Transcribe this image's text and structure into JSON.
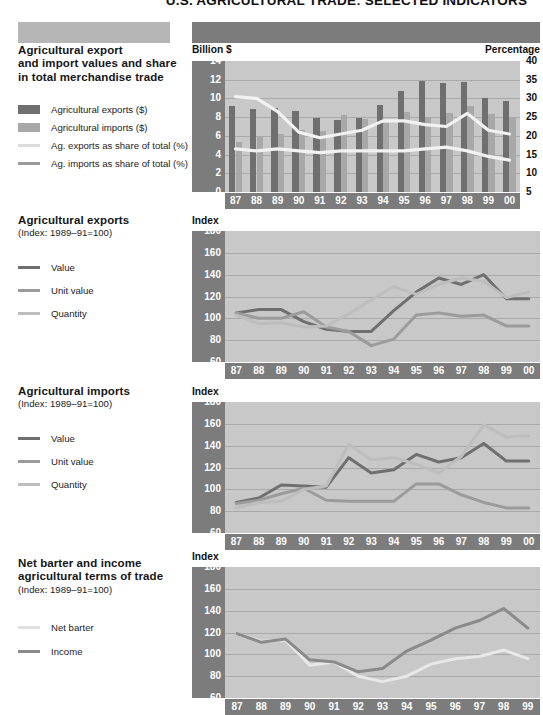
{
  "document": {
    "title": "U.S. AGRICULTURAL TRADE: SELECTED INDICATORS"
  },
  "colors": {
    "export_bar": "#6f6f6f",
    "import_bar": "#a8a8a8",
    "plot_bg": "#c8c8c8",
    "band": "#7c7c7c",
    "header_left": "#b6b6b6",
    "header_right": "#7c7c7c",
    "line_light": "#f2f2f2",
    "line_mid": "#9b9b9b",
    "line_dark": "#6f6f6f",
    "gridline": "#a9a9a9"
  },
  "sections": [
    {
      "title_line1": "Agricultural export",
      "title_line2": "and import values and share",
      "title_line3": "in total merchandise trade",
      "subtitle": "",
      "legend": [
        {
          "label": "Agricultural exports ($)",
          "swatch": "block",
          "color": "#6f6f6f"
        },
        {
          "label": "Agricultural imports ($)",
          "swatch": "block",
          "color": "#a8a8a8"
        },
        {
          "label": "Ag. exports as share of total (%)",
          "swatch": "line",
          "color": "#f2f2f2"
        },
        {
          "label": "Ag. imports as share of total (%)",
          "swatch": "line",
          "color": "#9b9b9b"
        }
      ]
    },
    {
      "title_line1": "Agricultural exports",
      "title_line2": "",
      "title_line3": "",
      "subtitle": "(Index: 1989–91=100)",
      "legend": [
        {
          "label": "Value",
          "swatch": "line",
          "color": "#6f6f6f"
        },
        {
          "label": "Unit value",
          "swatch": "line",
          "color": "#9b9b9b"
        },
        {
          "label": "Quantity",
          "swatch": "line",
          "color": "#bdbdbd"
        }
      ]
    },
    {
      "title_line1": "Agricultural imports",
      "title_line2": "",
      "title_line3": "",
      "subtitle": "(Index: 1989–91=100)",
      "legend": [
        {
          "label": "Value",
          "swatch": "line",
          "color": "#6f6f6f"
        },
        {
          "label": "Unit value",
          "swatch": "line",
          "color": "#9b9b9b"
        },
        {
          "label": "Quantity",
          "swatch": "line",
          "color": "#bdbdbd"
        }
      ]
    },
    {
      "title_line1": "Net barter and income",
      "title_line2": "agricultural terms of trade",
      "title_line3": "",
      "subtitle": "(Index: 1989–91=100)",
      "legend": [
        {
          "label": "Net barter",
          "swatch": "line",
          "color": "#e8e8e8"
        },
        {
          "label": "Income",
          "swatch": "line",
          "color": "#8a8a8a"
        }
      ]
    }
  ],
  "chart_data": [
    {
      "id": "trade-values-share",
      "type": "bar",
      "title": "Agricultural export and import values and share in total merchandise trade",
      "xlabel": "",
      "ylabel": "Billion $",
      "y2label": "Percentage",
      "ylim": [
        0,
        14
      ],
      "yticks": [
        0,
        2,
        4,
        6,
        8,
        10,
        12,
        14
      ],
      "y2lim": [
        5,
        40
      ],
      "y2ticks": [
        5,
        10,
        15,
        20,
        25,
        30,
        35,
        40
      ],
      "grid": true,
      "legend_position": "left-sidebar",
      "categories": [
        "87",
        "88",
        "89",
        "90",
        "91",
        "92",
        "93",
        "94",
        "95",
        "96",
        "97",
        "98",
        "99",
        "00"
      ],
      "series": [
        {
          "name": "Agricultural exports ($)",
          "kind": "bar",
          "axis": "left",
          "values": [
            9.2,
            8.9,
            9.0,
            8.7,
            7.9,
            7.7,
            7.9,
            9.3,
            10.8,
            11.9,
            11.6,
            11.8,
            10.0,
            9.7
          ]
        },
        {
          "name": "Agricultural imports ($)",
          "kind": "bar",
          "axis": "left",
          "values": [
            5.3,
            6.0,
            6.2,
            6.6,
            6.5,
            8.2,
            7.8,
            7.4,
            8.5,
            8.0,
            8.4,
            9.2,
            8.3,
            8.0
          ]
        },
        {
          "name": "Ag. exports as share of total (%)",
          "kind": "line",
          "axis": "right",
          "values": [
            30.5,
            30.0,
            26.5,
            21.0,
            19.5,
            20.5,
            21.5,
            24.0,
            24.0,
            23.0,
            22.5,
            26.0,
            21.5,
            20.5
          ]
        },
        {
          "name": "Ag. imports as share of total (%)",
          "kind": "line",
          "axis": "right",
          "values": [
            16.5,
            16.0,
            16.5,
            16.0,
            15.5,
            16.0,
            16.0,
            16.0,
            16.0,
            16.5,
            17.0,
            16.0,
            14.5,
            13.5
          ]
        }
      ]
    },
    {
      "id": "agricultural-exports-index",
      "type": "line",
      "title": "Agricultural exports",
      "subtitle": "(Index: 1989-91=100)",
      "xlabel": "",
      "ylabel": "Index",
      "ylim": [
        60,
        180
      ],
      "yticks": [
        60,
        80,
        100,
        120,
        140,
        160,
        180
      ],
      "grid": true,
      "legend_position": "left-sidebar",
      "categories": [
        "87",
        "88",
        "89",
        "90",
        "91",
        "92",
        "93",
        "94",
        "95",
        "96",
        "97",
        "98",
        "99",
        "00"
      ],
      "series": [
        {
          "name": "Value",
          "color": "#6f6f6f",
          "values": [
            105,
            108,
            108,
            97,
            90,
            88,
            88,
            107,
            124,
            137,
            131,
            140,
            118,
            118
          ]
        },
        {
          "name": "Unit value",
          "color": "#9b9b9b",
          "values": [
            105,
            100,
            100,
            106,
            92,
            88,
            75,
            81,
            103,
            105,
            102,
            103,
            93,
            93
          ]
        },
        {
          "name": "Quantity",
          "color": "#bdbdbd",
          "values": [
            103,
            95,
            96,
            92,
            93,
            104,
            117,
            129,
            122,
            131,
            137,
            134,
            119,
            124
          ]
        }
      ]
    },
    {
      "id": "agricultural-imports-index",
      "type": "line",
      "title": "Agricultural imports",
      "subtitle": "(Index: 1989-91=100)",
      "xlabel": "",
      "ylabel": "Index",
      "ylim": [
        60,
        180
      ],
      "yticks": [
        60,
        80,
        100,
        120,
        140,
        160,
        180
      ],
      "grid": true,
      "legend_position": "left-sidebar",
      "categories": [
        "87",
        "88",
        "89",
        "90",
        "91",
        "92",
        "93",
        "94",
        "95",
        "96",
        "97",
        "98",
        "99",
        "00"
      ],
      "series": [
        {
          "name": "Value",
          "color": "#6f6f6f",
          "values": [
            88,
            92,
            104,
            103,
            102,
            129,
            115,
            118,
            132,
            125,
            129,
            142,
            126,
            126
          ]
        },
        {
          "name": "Unit value",
          "color": "#9b9b9b",
          "values": [
            87,
            90,
            96,
            101,
            90,
            89,
            89,
            89,
            105,
            105,
            95,
            88,
            83,
            83
          ]
        },
        {
          "name": "Quantity",
          "color": "#bdbdbd",
          "values": [
            83,
            88,
            89,
            100,
            103,
            141,
            127,
            129,
            123,
            115,
            130,
            159,
            148,
            149
          ]
        }
      ]
    },
    {
      "id": "terms-of-trade-index",
      "type": "line",
      "title": "Net barter and income agricultural terms of trade",
      "subtitle": "(Index: 1989-91=100)",
      "xlabel": "",
      "ylabel": "Index",
      "ylim": [
        60,
        180
      ],
      "yticks": [
        60,
        80,
        100,
        120,
        140,
        160,
        180
      ],
      "grid": true,
      "legend_position": "left-sidebar",
      "categories": [
        "87",
        "88",
        "89",
        "90",
        "91",
        "92",
        "93",
        "94",
        "95",
        "96",
        "97",
        "98",
        "99"
      ],
      "series": [
        {
          "name": "Net barter",
          "color": "#e8e8e8",
          "values": [
            119,
            112,
            113,
            90,
            93,
            80,
            75,
            80,
            91,
            96,
            98,
            104,
            96
          ]
        },
        {
          "name": "Income",
          "color": "#8a8a8a",
          "values": [
            119,
            111,
            114,
            95,
            93,
            84,
            87,
            103,
            113,
            124,
            131,
            142,
            124
          ]
        }
      ]
    }
  ],
  "axis_units": {
    "billion": "Billion $",
    "percentage": "Percentage",
    "index": "Index"
  }
}
